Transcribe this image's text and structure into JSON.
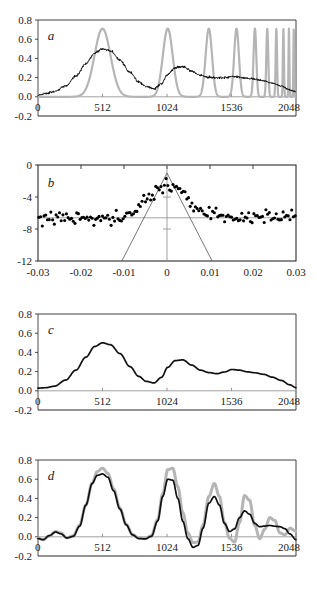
{
  "figure": {
    "background": "#ffffff",
    "width": 317,
    "height": 593,
    "colors": {
      "curve_black": "#111111",
      "curve_gray": "#b5b5b5",
      "axis": "#3a3a3a",
      "frame": "#2b2b2b",
      "zero_line": "#8a8a8a",
      "marker": "#000000"
    }
  },
  "chart_data": [
    {
      "id": "a",
      "type": "line",
      "panel_label": "a",
      "title": "",
      "xlabel": "",
      "ylabel": "",
      "xlim": [
        0,
        2048
      ],
      "ylim": [
        -0.2,
        0.8
      ],
      "xticks": [
        0,
        512,
        1024,
        1536,
        2048
      ],
      "xticklabels": [
        "0",
        "512",
        "1024",
        "1536",
        "2048"
      ],
      "yticks": [
        -0.2,
        0.0,
        0.2,
        0.4,
        0.6,
        0.8
      ],
      "yticklabels": [
        "-0.2",
        "0.0",
        "0.2",
        "0.4",
        "0.6",
        "0.8"
      ],
      "grid": false,
      "legend": "none",
      "series": [
        {
          "name": "model-comb-gray",
          "color": "#b5b5b5",
          "style": "peaks",
          "description": "Gray reference comb of Gaussian peaks of equal height 0.71 whose spacing and width shrink toward large x",
          "peak_height": 0.71,
          "baseline": 0.0,
          "peaks": [
            {
              "center": 512,
              "width": 150,
              "height": 0.71
            },
            {
              "center": 1030,
              "width": 92,
              "height": 0.71
            },
            {
              "center": 1356,
              "width": 60,
              "height": 0.71
            },
            {
              "center": 1576,
              "width": 45,
              "height": 0.71
            },
            {
              "center": 1722,
              "width": 26,
              "height": 0.71
            },
            {
              "center": 1820,
              "width": 18,
              "height": 0.71
            },
            {
              "center": 1892,
              "width": 13,
              "height": 0.71
            },
            {
              "center": 1948,
              "width": 10,
              "height": 0.71
            },
            {
              "center": 1992,
              "width": 8,
              "height": 0.71
            },
            {
              "center": 2030,
              "width": 7,
              "height": 0.71
            }
          ]
        },
        {
          "name": "measured-noisy-black",
          "color": "#111111",
          "style": "noisy-line",
          "description": "Noisy measured trace: broad bumps decaying with x, high-frequency noise riding on a smooth envelope",
          "noise_amplitude": 0.012,
          "envelope_x": [
            0,
            60,
            130,
            220,
            300,
            380,
            450,
            512,
            575,
            650,
            730,
            800,
            860,
            920,
            980,
            1030,
            1090,
            1150,
            1220,
            1290,
            1356,
            1420,
            1480,
            1540,
            1600,
            1660,
            1720,
            1790,
            1860,
            1930,
            2000,
            2048
          ],
          "envelope_y": [
            0.015,
            0.035,
            0.055,
            0.115,
            0.215,
            0.345,
            0.455,
            0.498,
            0.478,
            0.385,
            0.255,
            0.155,
            0.105,
            0.085,
            0.135,
            0.235,
            0.305,
            0.315,
            0.268,
            0.222,
            0.205,
            0.195,
            0.198,
            0.212,
            0.205,
            0.192,
            0.185,
            0.168,
            0.142,
            0.112,
            0.072,
            0.052
          ]
        }
      ]
    },
    {
      "id": "b",
      "type": "scatter",
      "panel_label": "b",
      "title": "",
      "xlabel": "",
      "ylabel": "",
      "xlim": [
        -0.03,
        0.03
      ],
      "ylim": [
        -12,
        0
      ],
      "xticks": [
        -0.03,
        -0.02,
        -0.01,
        0,
        0.01,
        0.02,
        0.03
      ],
      "xticklabels": [
        "-0.03",
        "-0.02",
        "-0.01",
        "0",
        "0.01",
        "0.02",
        "0.03"
      ],
      "yticks": [
        -12,
        -8,
        -4,
        0
      ],
      "yticklabels": [
        "-12",
        "-8",
        "-4",
        "0"
      ],
      "grid": false,
      "legend": "none",
      "boxed_frame": true,
      "noise_floor": -6.6,
      "noise_spread": 1.5,
      "central_peak": {
        "center": 0.0,
        "peak_value": -2.6,
        "half_width": 0.006
      },
      "overlay_triangle": {
        "description": "Thin straight-line V/triangle overlay apexing at x=0, y=-1.0 and descending to the frame bottom at y=-12",
        "apex_x": 0.0,
        "apex_y": -1.0,
        "left_base_x": -0.0105,
        "right_base_x": 0.0105,
        "base_y": -12
      },
      "crosshair": {
        "vertical_x": 0.0,
        "horizontal_y": -6.6
      },
      "marker_size": 2.0,
      "marker_color": "#000000"
    },
    {
      "id": "c",
      "type": "line",
      "panel_label": "c",
      "title": "",
      "xlabel": "",
      "ylabel": "",
      "xlim": [
        0,
        2048
      ],
      "ylim": [
        -0.2,
        0.8
      ],
      "xticks": [
        0,
        512,
        1024,
        1536,
        2048
      ],
      "xticklabels": [
        "0",
        "512",
        "1024",
        "1536",
        "2048"
      ],
      "yticks": [
        -0.2,
        0.0,
        0.2,
        0.4,
        0.6,
        0.8
      ],
      "yticklabels": [
        "-0.2",
        "0.0",
        "0.2",
        "0.4",
        "0.6",
        "0.8"
      ],
      "grid": false,
      "legend": "none",
      "series": [
        {
          "name": "smooth-envelope-black",
          "color": "#111111",
          "style": "line",
          "description": "Smooth denoised envelope of panel a black trace",
          "x": [
            0,
            60,
            130,
            220,
            300,
            380,
            450,
            512,
            575,
            650,
            730,
            800,
            860,
            920,
            980,
            1030,
            1090,
            1150,
            1220,
            1290,
            1356,
            1420,
            1480,
            1540,
            1600,
            1660,
            1720,
            1790,
            1860,
            1930,
            2000,
            2048
          ],
          "y": [
            0.028,
            0.032,
            0.048,
            0.112,
            0.215,
            0.35,
            0.462,
            0.5,
            0.48,
            0.388,
            0.252,
            0.15,
            0.098,
            0.082,
            0.14,
            0.245,
            0.315,
            0.322,
            0.268,
            0.215,
            0.19,
            0.178,
            0.196,
            0.222,
            0.215,
            0.198,
            0.188,
            0.172,
            0.142,
            0.108,
            0.062,
            0.032
          ]
        }
      ]
    },
    {
      "id": "d",
      "type": "line",
      "panel_label": "d",
      "title": "",
      "xlabel": "",
      "ylabel": "",
      "xlim": [
        0,
        2048
      ],
      "ylim": [
        -0.2,
        0.8
      ],
      "xticks": [
        0,
        512,
        1024,
        1536,
        2048
      ],
      "xticklabels": [
        "0",
        "512",
        "1024",
        "1536",
        "2048"
      ],
      "yticks": [
        -0.2,
        0.0,
        0.2,
        0.4,
        0.6,
        0.8
      ],
      "yticklabels": [
        "-0.2",
        "0.0",
        "0.2",
        "0.4",
        "0.6",
        "0.8"
      ],
      "grid": false,
      "legend": "none",
      "series": [
        {
          "name": "reference-gray",
          "color": "#b5b5b5",
          "style": "line",
          "description": "Gray reference reconstruction with faster decaying oscillations at large x",
          "x": [
            0,
            40,
            90,
            140,
            180,
            230,
            280,
            330,
            380,
            430,
            470,
            512,
            555,
            600,
            650,
            700,
            750,
            800,
            850,
            900,
            950,
            990,
            1030,
            1070,
            1110,
            1150,
            1190,
            1230,
            1270,
            1310,
            1356,
            1400,
            1440,
            1480,
            1520,
            1560,
            1600,
            1640,
            1680,
            1720,
            1760,
            1800,
            1840,
            1880,
            1920,
            1960,
            2000,
            2048
          ],
          "y": [
            -0.015,
            -0.03,
            0.01,
            0.055,
            0.04,
            -0.01,
            0.01,
            0.12,
            0.33,
            0.56,
            0.68,
            0.715,
            0.66,
            0.5,
            0.3,
            0.13,
            0.025,
            -0.012,
            -0.018,
            0.01,
            0.18,
            0.45,
            0.7,
            0.715,
            0.52,
            0.25,
            0.04,
            -0.06,
            -0.055,
            0.12,
            0.42,
            0.555,
            0.42,
            0.15,
            -0.015,
            -0.055,
            0.15,
            0.43,
            0.38,
            0.12,
            -0.02,
            0.08,
            0.2,
            0.17,
            0.04,
            0.02,
            0.09,
            0.06
          ]
        },
        {
          "name": "recovered-black",
          "color": "#111111",
          "style": "line",
          "description": "Black recovered signal tracking the gray reference with damped, slower oscillations",
          "x": [
            0,
            40,
            90,
            140,
            180,
            230,
            280,
            330,
            380,
            430,
            470,
            512,
            555,
            600,
            650,
            700,
            750,
            800,
            850,
            900,
            950,
            990,
            1030,
            1070,
            1110,
            1150,
            1190,
            1230,
            1270,
            1310,
            1356,
            1400,
            1440,
            1480,
            1520,
            1560,
            1600,
            1640,
            1680,
            1720,
            1760,
            1800,
            1840,
            1880,
            1920,
            1960,
            2000,
            2048
          ],
          "y": [
            -0.018,
            -0.03,
            0.012,
            0.05,
            0.032,
            -0.012,
            0.005,
            0.11,
            0.33,
            0.555,
            0.64,
            0.655,
            0.62,
            0.48,
            0.29,
            0.125,
            0.02,
            -0.018,
            -0.022,
            0.005,
            0.165,
            0.42,
            0.6,
            0.59,
            0.4,
            0.16,
            -0.02,
            -0.11,
            -0.09,
            0.09,
            0.35,
            0.42,
            0.33,
            0.14,
            0.055,
            0.082,
            0.2,
            0.27,
            0.235,
            0.14,
            0.105,
            0.112,
            0.118,
            0.11,
            0.105,
            0.085,
            0.03,
            -0.03
          ]
        }
      ]
    }
  ],
  "panel_geometry": {
    "panel_tops": [
      18,
      162,
      312,
      458
    ],
    "panel_height": 128,
    "plot_left": 38,
    "plot_right": 296
  }
}
